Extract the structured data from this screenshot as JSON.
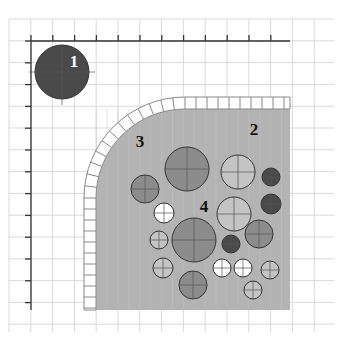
{
  "diagram": {
    "labels": [
      {
        "id": "1",
        "text": "1",
        "x": 74,
        "y": 67,
        "color": "#ffffff"
      },
      {
        "id": "2",
        "text": "2",
        "x": 254,
        "y": 135,
        "color": "#111111"
      },
      {
        "id": "3",
        "text": "3",
        "x": 140,
        "y": 147,
        "color": "#111111"
      },
      {
        "id": "4",
        "text": "4",
        "x": 204,
        "y": 212,
        "color": "#111111"
      }
    ],
    "colors": {
      "grid": "#d9d9d9",
      "axis": "#333333",
      "shaded_region": "#b3b3b3",
      "tile_border": "#888888",
      "dark": "#4a4a4a",
      "medium": "#8c8c8c",
      "light": "#c4c4c4",
      "white": "#ffffff"
    },
    "circles": [
      {
        "label": "1",
        "cx": 62,
        "cy": 72,
        "r": 27,
        "shade": "dark"
      },
      {
        "cx": 187,
        "cy": 169,
        "r": 22,
        "shade": "medium"
      },
      {
        "cx": 238,
        "cy": 172,
        "r": 17,
        "shade": "light"
      },
      {
        "cx": 271,
        "cy": 177,
        "r": 9,
        "shade": "dark"
      },
      {
        "cx": 145,
        "cy": 189,
        "r": 14,
        "shade": "medium"
      },
      {
        "cx": 271,
        "cy": 204,
        "r": 10,
        "shade": "dark"
      },
      {
        "cx": 234,
        "cy": 214,
        "r": 17,
        "shade": "light"
      },
      {
        "cx": 164,
        "cy": 213,
        "r": 10,
        "shade": "white"
      },
      {
        "cx": 194,
        "cy": 240,
        "r": 22,
        "shade": "medium"
      },
      {
        "cx": 259,
        "cy": 234,
        "r": 14,
        "shade": "medium"
      },
      {
        "cx": 231,
        "cy": 244,
        "r": 9,
        "shade": "dark"
      },
      {
        "cx": 159,
        "cy": 240,
        "r": 9,
        "shade": "light"
      },
      {
        "cx": 163,
        "cy": 268,
        "r": 10,
        "shade": "light"
      },
      {
        "cx": 222,
        "cy": 268,
        "r": 9,
        "shade": "white"
      },
      {
        "cx": 243,
        "cy": 268,
        "r": 9,
        "shade": "white"
      },
      {
        "cx": 270,
        "cy": 270,
        "r": 9,
        "shade": "light"
      },
      {
        "cx": 193,
        "cy": 285,
        "r": 14,
        "shade": "medium"
      },
      {
        "cx": 253,
        "cy": 290,
        "r": 9,
        "shade": "light"
      }
    ],
    "axes": {
      "origin_x": 31,
      "origin_y": 41,
      "x_end": 290,
      "y_end": 310,
      "tick_spacing": 21.8
    },
    "grid": {
      "x0": 9,
      "y0": 19,
      "x1": 334,
      "y1": 332,
      "spacing": 21.8
    }
  }
}
